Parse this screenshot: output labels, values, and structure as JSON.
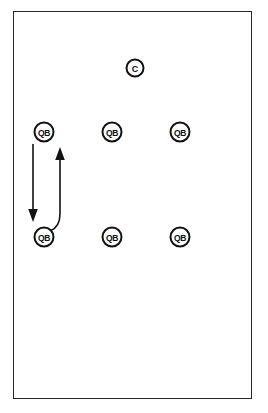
{
  "diagram": {
    "background_color": "#ffffff",
    "frame": {
      "name": "field-boundary",
      "stroke_color": "#262626",
      "x": 13,
      "y": 11,
      "width": 239,
      "height": 388
    },
    "markers": [
      {
        "id": "coach",
        "label": "C",
        "shape": "circle",
        "cx": 135,
        "cy": 68,
        "r": 8.5,
        "stroke_color": "#121212",
        "fill_color": "#ffffff"
      },
      {
        "id": "qb-top-left",
        "label": "QB",
        "shape": "circle",
        "cx": 44,
        "cy": 132,
        "r": 9.5,
        "stroke_color": "#121212",
        "fill_color": "#ffffff"
      },
      {
        "id": "qb-top-center",
        "label": "QB",
        "shape": "circle",
        "cx": 112,
        "cy": 132,
        "r": 9.5,
        "stroke_color": "#121212",
        "fill_color": "#ffffff"
      },
      {
        "id": "qb-top-right",
        "label": "QB",
        "shape": "circle",
        "cx": 180,
        "cy": 132,
        "r": 9.5,
        "stroke_color": "#121212",
        "fill_color": "#ffffff"
      },
      {
        "id": "qb-bottom-left",
        "label": "QB",
        "shape": "circle",
        "cx": 44,
        "cy": 237,
        "r": 9.5,
        "stroke_color": "#121212",
        "fill_color": "#ffffff"
      },
      {
        "id": "qb-bottom-center",
        "label": "QB",
        "shape": "circle",
        "cx": 112,
        "cy": 237,
        "r": 9.5,
        "stroke_color": "#121212",
        "fill_color": "#ffffff"
      },
      {
        "id": "qb-bottom-right",
        "label": "QB",
        "shape": "circle",
        "cx": 180,
        "cy": 237,
        "r": 9.5,
        "stroke_color": "#121212",
        "fill_color": "#ffffff"
      }
    ],
    "paths": [
      {
        "id": "downward-movement",
        "description": "straight line moving down from top-left QB to bottom-left QB",
        "direction": "down",
        "d": "M 33 144 L 33 210",
        "arrow_d": "M 33 222 L 28.2 209 L 37.8 209 Z",
        "stroke_color": "#121212"
      },
      {
        "id": "return-movement",
        "description": "curved line returning up from bottom-left QB to top-left QB",
        "direction": "up",
        "d": "M 50 231 C 58 228 60 222 60 214 L 60 160",
        "arrow_d": "M 60 147 L 55.2 160 L 64.8 160 Z",
        "stroke_color": "#121212"
      }
    ]
  }
}
